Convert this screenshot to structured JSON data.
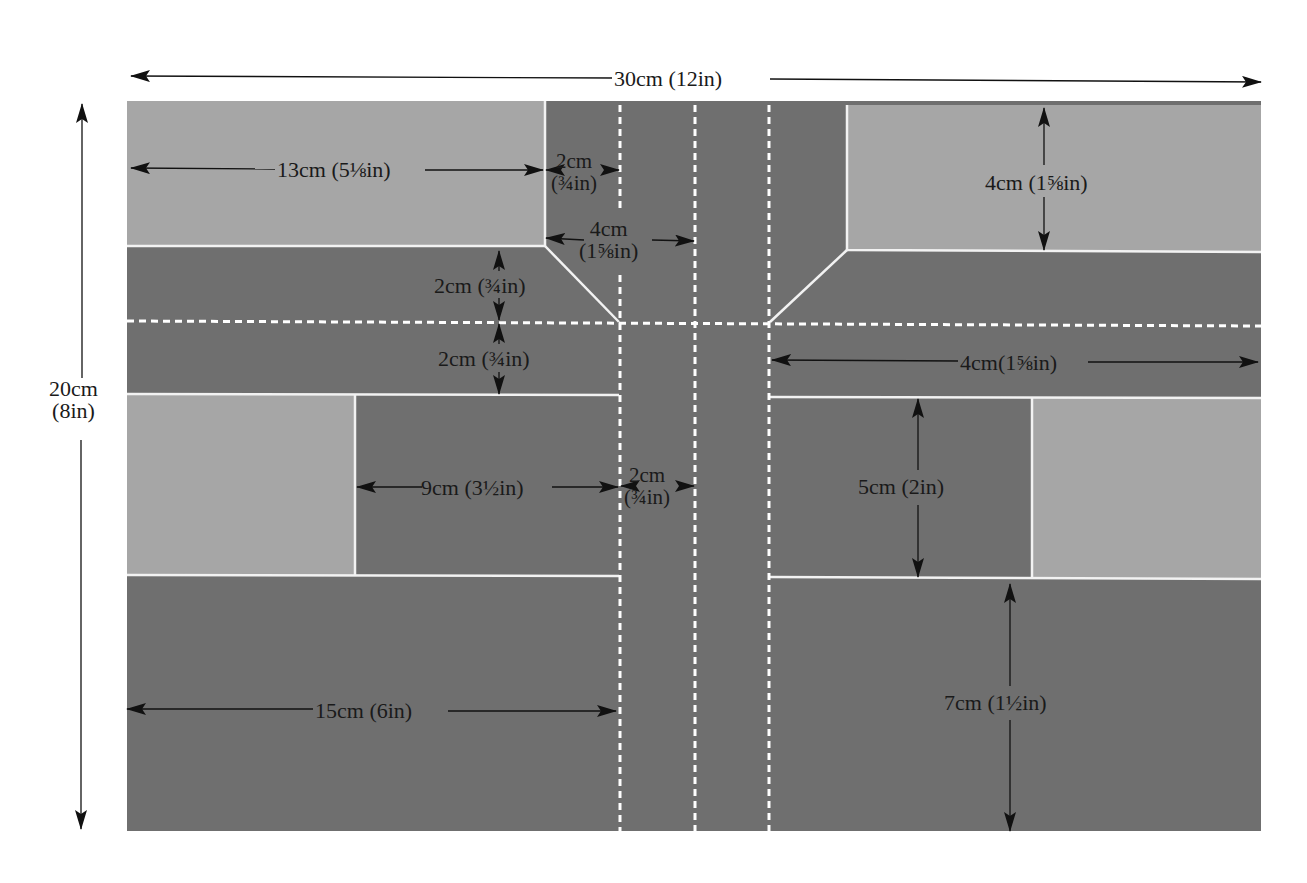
{
  "colors": {
    "background": "#ffffff",
    "road": "#6f6f6f",
    "pavement": "#a6a6a6",
    "kerb_line": "#f2f2f2",
    "lane_marking": "#ffffff",
    "annotation": "#111111"
  },
  "board": {
    "x": 127,
    "y": 101,
    "width": 1134,
    "height": 730
  },
  "overall_dimensions": {
    "width": {
      "label": "30cm (12in)",
      "cm": 30,
      "in": 12
    },
    "height": {
      "label_line1": "20cm",
      "label_line2": "(8in)",
      "cm": 20,
      "in": 8
    }
  },
  "regions": {
    "pavement_blocks": [
      {
        "name": "top-left-pavement",
        "x": 127,
        "y": 101,
        "w": 418,
        "h": 145
      },
      {
        "name": "top-right-pavement",
        "x": 847,
        "y": 105,
        "w": 414,
        "h": 146
      },
      {
        "name": "middle-left-pavement",
        "x": 127,
        "y": 395,
        "w": 228,
        "h": 180
      },
      {
        "name": "middle-right-pavement",
        "x": 1032,
        "y": 398,
        "w": 229,
        "h": 180
      }
    ]
  },
  "dimensions": [
    {
      "id": "top-left-width",
      "line1": "13cm (5⅛in)",
      "cm": 13
    },
    {
      "id": "top-inner-lane",
      "line1": "2cm",
      "line2": "(¾in)",
      "cm": 2
    },
    {
      "id": "top-road-width",
      "line1": "4cm",
      "line2": "(1⅝in)",
      "cm": 4
    },
    {
      "id": "top-right-height",
      "line1": "4cm (1⅝in)",
      "cm": 4
    },
    {
      "id": "left-upper-lane",
      "line1": "2cm (¾in)",
      "cm": 2
    },
    {
      "id": "left-lower-lane",
      "line1": "2cm (¾in)",
      "cm": 2
    },
    {
      "id": "right-road-width",
      "line1": "4cm(1⅝in)",
      "cm": 4
    },
    {
      "id": "middle-left-width",
      "line1": "9cm (3½in)",
      "cm": 9
    },
    {
      "id": "middle-center-lane",
      "line1": "2cm",
      "line2": "(¾in)",
      "cm": 2
    },
    {
      "id": "middle-right-height",
      "line1": "5cm (2in)",
      "cm": 5
    },
    {
      "id": "bottom-left-width",
      "line1": "15cm (6in)",
      "cm": 15
    },
    {
      "id": "bottom-right-height",
      "line1": "7cm (1½in)",
      "cm": 7
    }
  ]
}
